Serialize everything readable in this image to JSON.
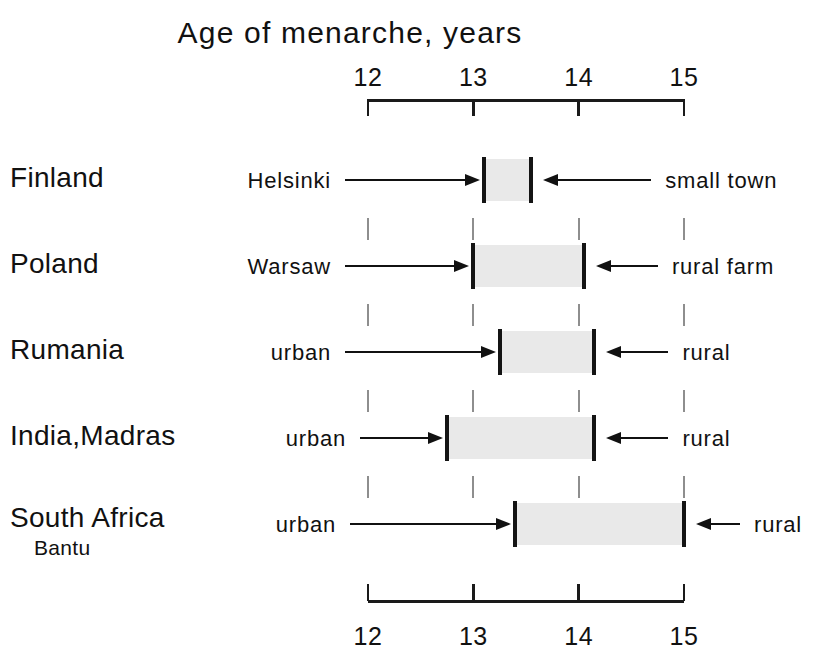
{
  "chart_data": {
    "type": "bar",
    "title": "Age of menarche, years",
    "xlabel": "Age of menarche, years",
    "ylabel": "",
    "xlim": [
      12,
      15
    ],
    "xticks": [
      12,
      13,
      14,
      15
    ],
    "xtick_labels": [
      "12",
      "13",
      "14",
      "15"
    ],
    "grid": false,
    "orientation": "horizontal",
    "axis_top": true,
    "axis_bottom": true,
    "note": "Horizontal range bars spanning urban (left end) to rural (right end) mean age of menarche for each population.",
    "categories": [
      "Finland",
      "Poland",
      "Rumania",
      "India, Madras",
      "South Africa Bantu"
    ],
    "rows": [
      {
        "country": "Finland",
        "country_sub": "",
        "left_label": "Helsinki",
        "right_label": "small town",
        "start": 13.1,
        "end": 13.55
      },
      {
        "country": "Poland",
        "country_sub": "",
        "left_label": "Warsaw",
        "right_label": "rural farm",
        "start": 13.0,
        "end": 14.05
      },
      {
        "country": "Rumania",
        "country_sub": "",
        "left_label": "urban",
        "right_label": "rural",
        "start": 13.25,
        "end": 14.15
      },
      {
        "country": "India,Madras",
        "country_sub": "",
        "left_label": "urban",
        "right_label": "rural",
        "start": 12.75,
        "end": 14.15
      },
      {
        "country": "South Africa",
        "country_sub": "Bantu",
        "left_label": "urban",
        "right_label": "rural",
        "start": 13.4,
        "end": 15.0
      }
    ],
    "colors": {
      "bar_fill": "#e9e9e9",
      "bar_cap": "#141414",
      "axis": "#1a1a1a",
      "text": "#111111",
      "grid_dash": "#8e8e8e",
      "background": "#ffffff"
    }
  }
}
